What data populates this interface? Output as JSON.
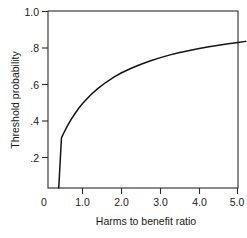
{
  "chart_data": {
    "type": "line",
    "title": "",
    "subtitle": "",
    "xlabel": "Harms to benefit ratio",
    "ylabel": "Threshold probability",
    "xlim": [
      0,
      5.2
    ],
    "ylim": [
      0.0,
      1.0
    ],
    "grid": false,
    "legend": null,
    "xticks": [
      0,
      1.0,
      2.0,
      3.0,
      4.0,
      5.0
    ],
    "xtick_labels": [
      "0",
      "1.0",
      "2.0",
      "3.0",
      "4.0",
      "5.0"
    ],
    "yticks": [
      0.2,
      0.4,
      0.6,
      0.8,
      1.0
    ],
    "ytick_labels": [
      ".2",
      ".4",
      ".6",
      ".8",
      "1.0"
    ],
    "annotations": [],
    "series": [
      {
        "name": "Threshold probability",
        "relationship": "p = R / (1 + R)",
        "x": [
          0.38,
          0.45,
          0.5,
          0.6,
          0.7,
          0.8,
          0.9,
          1.0,
          1.2,
          1.4,
          1.6,
          1.8,
          2.0,
          2.25,
          2.5,
          2.75,
          3.0,
          3.25,
          3.5,
          3.75,
          4.0,
          4.25,
          4.5,
          4.75,
          5.0,
          5.2
        ],
        "y": [
          0.02,
          0.31,
          0.333,
          0.375,
          0.412,
          0.444,
          0.474,
          0.5,
          0.545,
          0.583,
          0.615,
          0.643,
          0.667,
          0.692,
          0.714,
          0.733,
          0.75,
          0.765,
          0.778,
          0.789,
          0.8,
          0.81,
          0.818,
          0.826,
          0.833,
          0.839
        ]
      }
    ]
  },
  "axes": {
    "x_title": "Harms to benefit ratio",
    "y_title": "Threshold probability",
    "x_tick_labels": [
      {
        "value": "0",
        "pos": 0
      },
      {
        "value": "1.0",
        "pos": 1.0
      },
      {
        "value": "2.0",
        "pos": 2.0
      },
      {
        "value": "3.0",
        "pos": 3.0
      },
      {
        "value": "4.0",
        "pos": 4.0
      },
      {
        "value": "5.0",
        "pos": 5.0
      }
    ],
    "y_tick_labels": [
      {
        "value": "1.0",
        "pos": 1.0
      },
      {
        "value": ".8",
        "pos": 0.8
      },
      {
        "value": ".6",
        "pos": 0.6
      },
      {
        "value": ".4",
        "pos": 0.4
      },
      {
        "value": ".2",
        "pos": 0.2
      }
    ]
  },
  "colors": {
    "curve": "#151515",
    "frame": "#2b2b2b",
    "text": "#1a1a1a",
    "background": "#ffffff"
  }
}
